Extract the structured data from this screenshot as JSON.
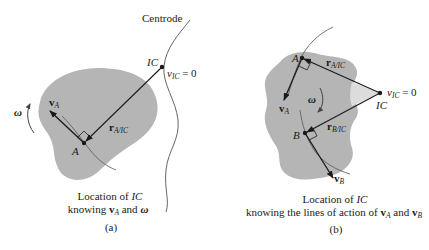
{
  "panel_a": {
    "centrode_label": "Centrode",
    "ic_label": "IC",
    "v_ic_label": "v",
    "v_ic_sub": "IC",
    "v_ic_eq": " = 0",
    "point_a_label": "A",
    "va_label": "v",
    "va_sub": "A",
    "r_label": "r",
    "r_sub": "A/IC",
    "omega_label": "ω",
    "caption_line1_pre": "Location of ",
    "caption_line1_ic": "IC",
    "caption_line2_pre": "knowing ",
    "caption_line2_v": "v",
    "caption_line2_vsub": "A",
    "caption_line2_and": " and ",
    "caption_line2_omega": "ω",
    "tag": "(a)"
  },
  "panel_b": {
    "ic_label": "IC",
    "v_ic_label": "v",
    "v_ic_sub": "IC",
    "v_ic_eq": " = 0",
    "point_a_label": "A",
    "point_b_label": "B",
    "va_label": "v",
    "va_sub": "A",
    "vb_label": "v",
    "vb_sub": "B",
    "ra_label": "r",
    "ra_sub": "A/IC",
    "rb_label": "r",
    "rb_sub": "B/IC",
    "omega_label": "ω",
    "caption_line1_pre": "Location of ",
    "caption_line1_ic": "IC",
    "caption_line2_pre": "knowing the lines of action of ",
    "caption_line2_va": "v",
    "caption_line2_vasub": "A",
    "caption_line2_and": " and ",
    "caption_line2_vb": "v",
    "caption_line2_vbsub": "B",
    "tag": "(b)"
  },
  "colors": {
    "body_fill": "#b5b5b5",
    "light_region": "#dcdcdc",
    "line": "#1a1a1a",
    "curve": "#555555",
    "background": "#ffffff"
  }
}
